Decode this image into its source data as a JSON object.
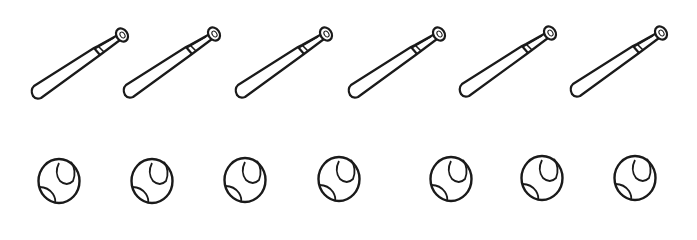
{
  "scene": {
    "title": "Baseball bats and balls counting picture",
    "stroke_color": "#1a1a1a",
    "fill_color": "#ffffff"
  },
  "bats": {
    "count": 6,
    "icon": "baseball-bat-icon",
    "items": [
      {
        "x": 28,
        "y": 24
      },
      {
        "x": 120,
        "y": 23
      },
      {
        "x": 232,
        "y": 23
      },
      {
        "x": 345,
        "y": 23
      },
      {
        "x": 456,
        "y": 22
      },
      {
        "x": 567,
        "y": 22
      }
    ]
  },
  "balls": {
    "count": 7,
    "icon": "baseball-icon",
    "items": [
      {
        "x": 36,
        "y": 157
      },
      {
        "x": 129,
        "y": 157
      },
      {
        "x": 222,
        "y": 156
      },
      {
        "x": 316,
        "y": 155
      },
      {
        "x": 428,
        "y": 155
      },
      {
        "x": 519,
        "y": 154
      },
      {
        "x": 612,
        "y": 154
      }
    ]
  }
}
